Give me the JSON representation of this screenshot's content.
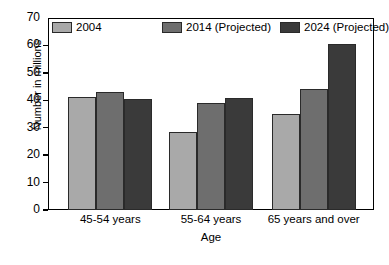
{
  "chart_data": {
    "type": "bar",
    "title": "",
    "xlabel": "Age",
    "ylabel": "Number in millions",
    "categories": [
      "45-54 years",
      "55-64 years",
      "65 years and over"
    ],
    "series": [
      {
        "name": "2004",
        "color": "#a9a9a9",
        "values": [
          41.3,
          28.5,
          35.1
        ]
      },
      {
        "name": "2014 (Projected)",
        "color": "#6e6e6e",
        "values": [
          43.2,
          39.0,
          44.2
        ]
      },
      {
        "name": "2024 (Projected)",
        "color": "#3a3a3a",
        "values": [
          40.3,
          40.7,
          60.5
        ]
      }
    ],
    "ylim": [
      0,
      70
    ],
    "yticks": [
      0,
      10,
      20,
      30,
      40,
      50,
      60,
      70
    ],
    "ytick_labels": [
      "0",
      "10",
      "20",
      "30",
      "40",
      "50",
      "60",
      "70"
    ],
    "grid": false,
    "legend_position": "top-inside"
  },
  "axes": {
    "y_title": "Number in millions",
    "x_title": "Age"
  }
}
